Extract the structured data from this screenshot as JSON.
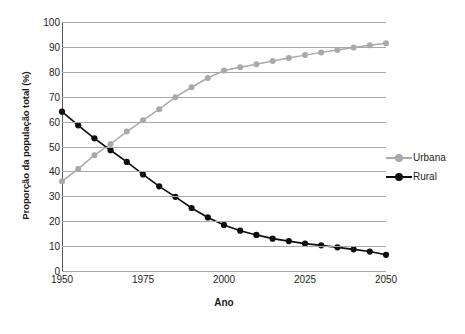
{
  "chart_data": {
    "type": "line",
    "title": "",
    "xlabel": "Ano",
    "ylabel": "Proporção da população total (%)",
    "xlim": [
      1950,
      2050
    ],
    "ylim": [
      0,
      100
    ],
    "xticks": [
      1950,
      1975,
      2000,
      2025,
      2050
    ],
    "yticks": [
      0,
      10,
      20,
      30,
      40,
      50,
      60,
      70,
      80,
      90,
      100
    ],
    "grid": "horizontal",
    "legend_position": "right",
    "x": [
      1950,
      1955,
      1960,
      1965,
      1970,
      1975,
      1980,
      1985,
      1990,
      1995,
      2000,
      2005,
      2010,
      2015,
      2020,
      2025,
      2030,
      2035,
      2040,
      2045,
      2050
    ],
    "series": [
      {
        "name": "Urbana",
        "color": "#a7a9ac",
        "marker": "circle",
        "values": [
          36.0,
          41.0,
          46.5,
          51.0,
          56.0,
          60.5,
          65.0,
          69.8,
          73.8,
          77.5,
          80.5,
          81.8,
          83.0,
          84.3,
          85.5,
          86.7,
          87.8,
          88.8,
          89.8,
          90.7,
          91.5
        ]
      },
      {
        "name": "Rural",
        "color": "#0d0d0d",
        "marker": "circle",
        "values": [
          64.0,
          58.5,
          53.3,
          48.5,
          43.8,
          38.8,
          34.0,
          29.8,
          25.3,
          21.5,
          18.5,
          16.2,
          14.5,
          13.0,
          12.0,
          11.0,
          10.3,
          9.5,
          8.7,
          7.8,
          6.5
        ]
      }
    ]
  },
  "axis": {
    "y_tick_labels": [
      "100",
      "90",
      "80",
      "70",
      "60",
      "50",
      "40",
      "30",
      "20",
      "10",
      "0"
    ],
    "x_tick_labels": [
      "1950",
      "1975",
      "2000",
      "2025",
      "2050"
    ],
    "y_title": "Proporção da população total (%)",
    "x_title": "Ano"
  },
  "legend": {
    "items": [
      {
        "label": "Urbana",
        "color": "#a7a9ac"
      },
      {
        "label": "Rural",
        "color": "#0d0d0d"
      }
    ]
  },
  "caption": {
    "clipped_text": ""
  },
  "colors": {
    "urbana": "#a7a9ac",
    "rural": "#0d0d0d",
    "gridline": "#a7a9ac",
    "axis": "#58595b",
    "text": "#231f20"
  }
}
